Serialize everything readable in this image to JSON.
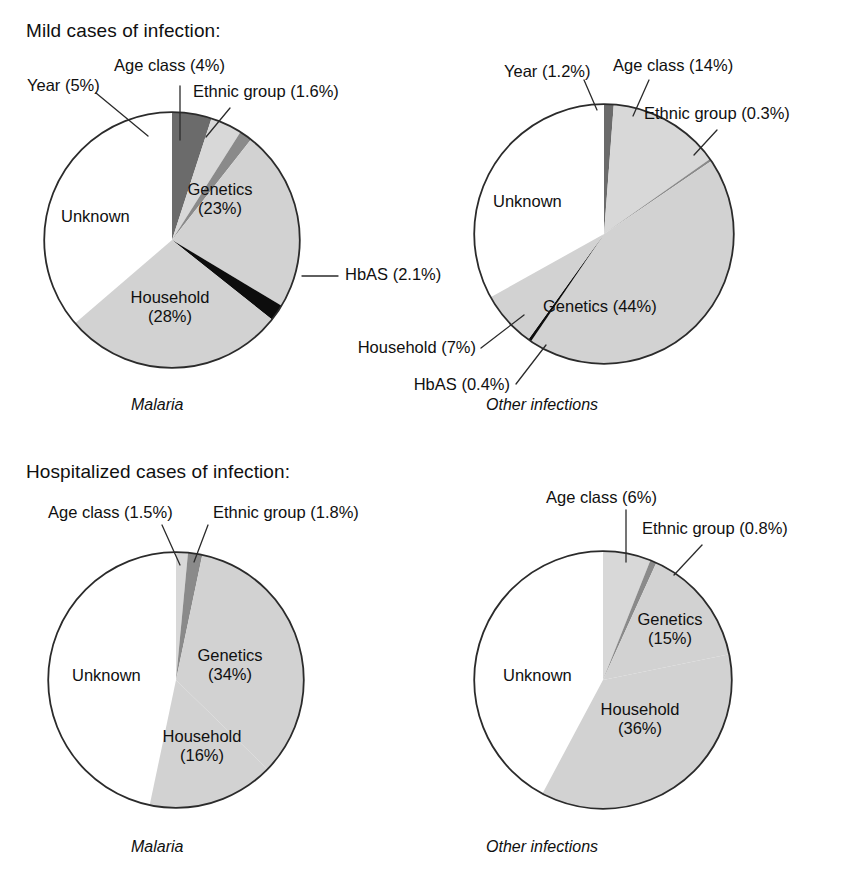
{
  "figure": {
    "width": 843,
    "height": 879,
    "sections": [
      {
        "id": "mild",
        "title": "Mild cases of infection:"
      },
      {
        "id": "hospitalized",
        "title": "Hospitalized cases of infection:"
      }
    ],
    "captions": {
      "malaria": "Malaria",
      "other": "Other infections"
    },
    "colors": {
      "unknown": "#ffffff",
      "genetics": "#d2d2d2",
      "household": "#d2d2d2",
      "age_class": "#d8d8d8",
      "year": "#6b6b6b",
      "ethnic_group": "#8a8a8a",
      "hbas": "#0d0d0d",
      "outline": "#2b2b2b",
      "text": "#101010",
      "leader": "#2b2b2b"
    }
  },
  "chart_data": [
    {
      "type": "pie",
      "id": "mild-malaria",
      "title": "Mild cases of infection:",
      "subtitle": "Malaria",
      "legend": "none",
      "categories": [
        "Unknown",
        "Year",
        "Age class",
        "Ethnic group",
        "Genetics",
        "HbAS",
        "Household"
      ],
      "values": [
        36.3,
        5,
        4,
        1.6,
        23,
        2.1,
        28
      ],
      "labels": [
        {
          "key": "unknown",
          "text": "Unknown",
          "pct": "",
          "display": "Unknown",
          "placement": "inside",
          "leader": false
        },
        {
          "key": "year",
          "text": "Year",
          "pct": "(5%)",
          "display": "Year (5%)",
          "placement": "outside",
          "leader": true
        },
        {
          "key": "age_class",
          "text": "Age class",
          "pct": "(4%)",
          "display": "Age class (4%)",
          "placement": "outside",
          "leader": true
        },
        {
          "key": "ethnic_group",
          "text": "Ethnic group",
          "pct": "(1.6%)",
          "display": "Ethnic group (1.6%)",
          "placement": "outside",
          "leader": true
        },
        {
          "key": "genetics",
          "text": "Genetics",
          "pct": "(23%)",
          "display": "Genetics (23%)",
          "placement": "inside",
          "leader": false
        },
        {
          "key": "hbas",
          "text": "HbAS",
          "pct": "(2.1%)",
          "display": "HbAS (2.1%)",
          "placement": "outside",
          "leader": true
        },
        {
          "key": "household",
          "text": "Household",
          "pct": "(28%)",
          "display": "Household (28%)",
          "placement": "inside",
          "leader": false
        }
      ]
    },
    {
      "type": "pie",
      "id": "mild-other",
      "title": "Mild cases of infection:",
      "subtitle": "Other infections",
      "legend": "none",
      "categories": [
        "Unknown",
        "Year",
        "Age class",
        "Ethnic group",
        "Genetics",
        "HbAS",
        "Household"
      ],
      "values": [
        33.1,
        1.2,
        14,
        0.3,
        44,
        0.4,
        7
      ],
      "labels": [
        {
          "key": "unknown",
          "text": "Unknown",
          "pct": "",
          "display": "Unknown",
          "placement": "inside",
          "leader": false
        },
        {
          "key": "year",
          "text": "Year",
          "pct": "(1.2%)",
          "display": "Year (1.2%)",
          "placement": "outside",
          "leader": true
        },
        {
          "key": "age_class",
          "text": "Age class",
          "pct": "(14%)",
          "display": "Age class (14%)",
          "placement": "outside",
          "leader": true
        },
        {
          "key": "ethnic_group",
          "text": "Ethnic group",
          "pct": "(0.3%)",
          "display": "Ethnic group (0.3%)",
          "placement": "outside",
          "leader": true
        },
        {
          "key": "genetics",
          "text": "Genetics",
          "pct": "(44%)",
          "display": "Genetics (44%)",
          "placement": "inside",
          "leader": false
        },
        {
          "key": "hbas",
          "text": "HbAS",
          "pct": "(0.4%)",
          "display": "HbAS (0.4%)",
          "placement": "outside",
          "leader": true
        },
        {
          "key": "household",
          "text": "Household",
          "pct": "(7%)",
          "display": "Household (7%)",
          "placement": "outside",
          "leader": true
        }
      ]
    },
    {
      "type": "pie",
      "id": "hosp-malaria",
      "title": "Hospitalized cases of infection:",
      "subtitle": "Malaria",
      "legend": "none",
      "categories": [
        "Unknown",
        "Age class",
        "Ethnic group",
        "Genetics",
        "Household"
      ],
      "values": [
        46.7,
        1.5,
        1.8,
        34,
        16
      ],
      "labels": [
        {
          "key": "unknown",
          "text": "Unknown",
          "pct": "",
          "display": "Unknown",
          "placement": "inside",
          "leader": false
        },
        {
          "key": "age_class",
          "text": "Age class",
          "pct": "(1.5%)",
          "display": "Age class (1.5%)",
          "placement": "outside",
          "leader": true
        },
        {
          "key": "ethnic_group",
          "text": "Ethnic group",
          "pct": "(1.8%)",
          "display": "Ethnic group (1.8%)",
          "placement": "outside",
          "leader": true
        },
        {
          "key": "genetics",
          "text": "Genetics",
          "pct": "(34%)",
          "display": "Genetics (34%)",
          "placement": "inside",
          "leader": false
        },
        {
          "key": "household",
          "text": "Household",
          "pct": "(16%)",
          "display": "Household (16%)",
          "placement": "inside",
          "leader": false
        }
      ]
    },
    {
      "type": "pie",
      "id": "hosp-other",
      "title": "Hospitalized cases of infection:",
      "subtitle": "Other infections",
      "legend": "none",
      "categories": [
        "Unknown",
        "Age class",
        "Ethnic group",
        "Genetics",
        "Household"
      ],
      "values": [
        42.2,
        6,
        0.8,
        15,
        36
      ],
      "labels": [
        {
          "key": "unknown",
          "text": "Unknown",
          "pct": "",
          "display": "Unknown",
          "placement": "inside",
          "leader": false
        },
        {
          "key": "age_class",
          "text": "Age class",
          "pct": "(6%)",
          "display": "Age class (6%)",
          "placement": "outside",
          "leader": true
        },
        {
          "key": "ethnic_group",
          "text": "Ethnic group",
          "pct": "(0.8%)",
          "display": "Ethnic group (0.8%)",
          "placement": "outside",
          "leader": true
        },
        {
          "key": "genetics",
          "text": "Genetics",
          "pct": "(15%)",
          "display": "Genetics (15%)",
          "placement": "inside",
          "leader": false
        },
        {
          "key": "household",
          "text": "Household",
          "pct": "(36%)",
          "display": "Household (36%)",
          "placement": "inside",
          "leader": false
        }
      ]
    }
  ],
  "text": {
    "mild_title": "Mild cases of infection:",
    "hosp_title": "Hospitalized cases of infection:",
    "malaria": "Malaria",
    "other_infections": "Other infections",
    "p1": {
      "unknown": "Unknown",
      "year": "Year (5%)",
      "age_class": "Age class (4%)",
      "ethnic_group": "Ethnic group (1.6%)",
      "genetics_l1": "Genetics",
      "genetics_l2": "(23%)",
      "hbas": "HbAS (2.1%)",
      "household_l1": "Household",
      "household_l2": "(28%)"
    },
    "p2": {
      "unknown": "Unknown",
      "year": "Year (1.2%)",
      "age_class": "Age class (14%)",
      "ethnic_group": "Ethnic group (0.3%)",
      "genetics": "Genetics (44%)",
      "hbas": "HbAS (0.4%)",
      "household": "Household (7%)"
    },
    "p3": {
      "unknown": "Unknown",
      "age_class": "Age class (1.5%)",
      "ethnic_group": "Ethnic group (1.8%)",
      "genetics_l1": "Genetics",
      "genetics_l2": "(34%)",
      "household_l1": "Household",
      "household_l2": "(16%)"
    },
    "p4": {
      "unknown": "Unknown",
      "age_class": "Age class (6%)",
      "ethnic_group": "Ethnic group (0.8%)",
      "genetics_l1": "Genetics",
      "genetics_l2": "(15%)",
      "household_l1": "Household",
      "household_l2": "(36%)"
    }
  }
}
